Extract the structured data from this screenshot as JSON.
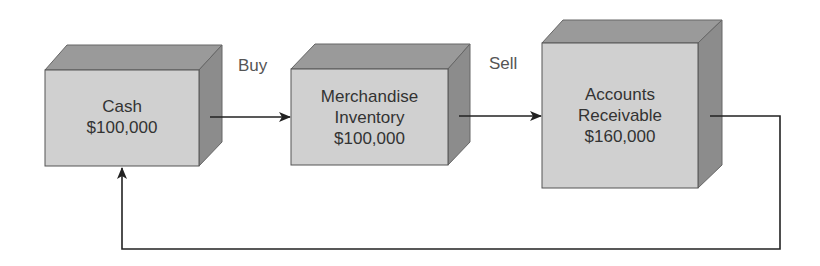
{
  "diagram": {
    "title": "",
    "nodes": [
      {
        "id": "cash",
        "lines": [
          "Cash",
          "$100,000"
        ]
      },
      {
        "id": "inventory",
        "lines": [
          "Merchandise",
          "Inventory",
          "$100,000"
        ]
      },
      {
        "id": "receivables",
        "lines": [
          "Accounts",
          "Receivable",
          "$160,000"
        ]
      }
    ],
    "edges": [
      {
        "from": "cash",
        "to": "inventory",
        "label": "Buy"
      },
      {
        "from": "inventory",
        "to": "receivables",
        "label": "Sell"
      },
      {
        "from": "receivables",
        "to": "cash",
        "label": ""
      }
    ],
    "colors": {
      "front": "#d0d0d0",
      "top": "#9a9a9a",
      "side": "#8c8c8c",
      "stroke": "#555555",
      "arrow": "#222222"
    }
  }
}
